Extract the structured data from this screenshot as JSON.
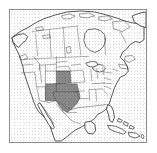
{
  "figure": {
    "title": "",
    "caption": "",
    "background_color": "#ffffff",
    "frame_color": "#8d8d8d"
  },
  "map": {
    "name": "north-america-reference-map",
    "projection_hint": "lambert-conformal-conic",
    "extent_label": "North America",
    "style": {
      "land_fill": "#ffffff",
      "water_fill": "#ffffff",
      "coastline_color": "#2b2b2b",
      "internal_border_color": "#4a4a4a",
      "highlight_fill": "#8a8a8a",
      "highlight_stroke": "#4a4a4a"
    },
    "features": [
      {
        "id": "canada",
        "label": "Canada",
        "type": "country",
        "highlighted": false
      },
      {
        "id": "united-states",
        "label": "United States",
        "type": "country",
        "highlighted": false
      },
      {
        "id": "mexico",
        "label": "Mexico",
        "type": "country",
        "highlighted": false
      },
      {
        "id": "greenland",
        "label": "Greenland",
        "type": "country",
        "highlighted": false
      },
      {
        "id": "cuba",
        "label": "Cuba",
        "type": "island",
        "highlighted": false
      },
      {
        "id": "hispaniola",
        "label": "Hispaniola",
        "type": "island",
        "highlighted": false
      },
      {
        "id": "bahamas",
        "label": "Bahamas",
        "type": "island",
        "highlighted": false
      }
    ],
    "highlighted_region": {
      "label": "Southern Great Plains",
      "fill_color": "#8a8a8a",
      "states": [
        {
          "code": "TX",
          "label": "Texas"
        },
        {
          "code": "OK",
          "label": "Oklahoma"
        },
        {
          "code": "KS",
          "label": "Kansas"
        },
        {
          "code": "NM",
          "label": "New Mexico"
        },
        {
          "code": "CO",
          "label": "Colorado"
        }
      ]
    },
    "legend": {
      "visible": false,
      "entries": []
    },
    "labels": {
      "visible": false,
      "items": []
    },
    "graticule": {
      "visible": false
    },
    "scalebar": {
      "visible": false
    },
    "north_arrow": {
      "visible": false
    }
  }
}
